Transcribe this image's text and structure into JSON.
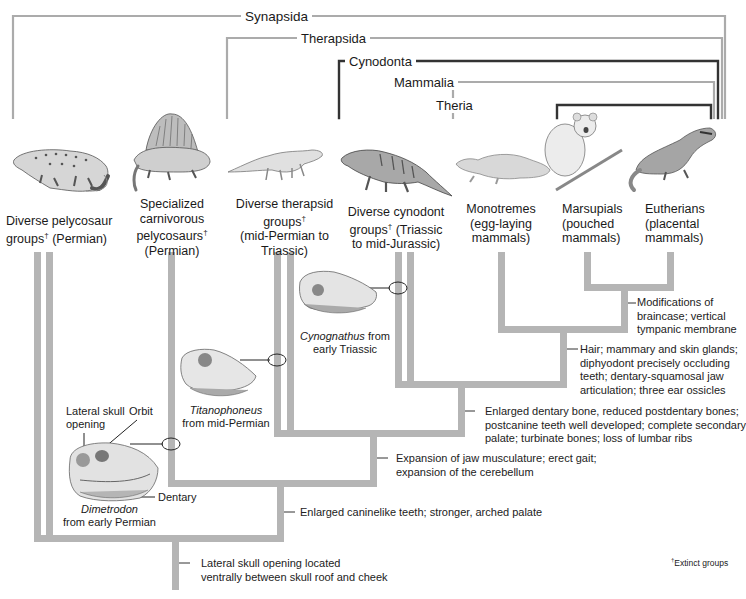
{
  "clades": [
    {
      "name": "Synapsida"
    },
    {
      "name": "Therapsida"
    },
    {
      "name": "Cynodonta"
    },
    {
      "name": "Mammalia"
    },
    {
      "name": "Theria"
    }
  ],
  "taxa": [
    {
      "lines": [
        "Diverse pelycosaur",
        "groups† (Permian)"
      ],
      "extinct": true
    },
    {
      "lines": [
        "Specialized",
        "carnivorous",
        "pelycosaurs†",
        "(Permian)"
      ],
      "extinct": true
    },
    {
      "lines": [
        "Diverse therapsid",
        "groups†",
        "(mid-Permian to",
        "Triassic)"
      ],
      "extinct": true
    },
    {
      "lines": [
        "Diverse cynodont",
        "groups† (Triassic",
        "to mid-Jurassic)"
      ],
      "extinct": true
    },
    {
      "lines": [
        "Monotremes",
        "(egg-laying",
        "mammals)"
      ],
      "extinct": false
    },
    {
      "lines": [
        "Marsupials",
        "(pouched",
        "mammals)"
      ],
      "extinct": false
    },
    {
      "lines": [
        "Eutherians",
        "(placental",
        "mammals)"
      ],
      "extinct": false
    }
  ],
  "taxa_text": {
    "t0_l1": "Diverse pelycosaur",
    "t0_l2": "groups",
    "t0_l2b": " (Permian)",
    "t1_l1": "Specialized",
    "t1_l2": "carnivorous",
    "t1_l3": "pelycosaurs",
    "t1_l4": "(Permian)",
    "t2_l1": "Diverse therapsid",
    "t2_l2": "groups",
    "t2_l3": "(mid-Permian to",
    "t2_l4": "Triassic)",
    "t3_l1": "Diverse cynodont",
    "t3_l2": "groups",
    "t3_l2b": " (Triassic",
    "t3_l3": "to mid-Jurassic)",
    "t4_l1": "Monotremes",
    "t4_l2": "(egg-laying",
    "t4_l3": "mammals)",
    "t5_l1": "Marsupials",
    "t5_l2": "(pouched",
    "t5_l3": "mammals)",
    "t6_l1": "Eutherians",
    "t6_l2": "(placental",
    "t6_l3": "mammals)",
    "dagger": "†"
  },
  "traits": {
    "theria": [
      "Modifications of",
      "braincase; vertical",
      "tympanic membrane"
    ],
    "mammalia": [
      "Hair; mammary and skin glands;",
      "diphyodont precisely occluding",
      "teeth; dentary-squamosal jaw",
      "articulation; three ear ossicles"
    ],
    "cynodonta": [
      "Enlarged dentary bone, reduced postdentary bones;",
      "postcanine teeth well developed; complete secondary",
      "palate; turbinate bones; loss of lumbar ribs"
    ],
    "therapsida": [
      "Expansion of jaw musculature; erect gait;",
      "expansion of the cerebellum"
    ],
    "sphenacodont": [
      "Enlarged caninelike teeth; stronger, arched palate"
    ],
    "synapsida": [
      "Lateral skull opening located",
      "ventrally between skull roof and cheek"
    ]
  },
  "fossils": {
    "cynognathus": {
      "genus": "Cynognathus",
      "rest1": " from",
      "line2": "early Triassic"
    },
    "titanophoneus": {
      "genus": "Titanophoneus",
      "line2": "from mid-Permian"
    },
    "dimetrodon": {
      "genus": "Dimetrodon",
      "line2": "from early Permian"
    }
  },
  "annotations": {
    "lateral_skull_l1": "Lateral skull",
    "lateral_skull_l2": "opening",
    "orbit": "Orbit",
    "dentary": "Dentary"
  },
  "footnote": {
    "symbol": "†",
    "text": "Extinct groups"
  },
  "colors": {
    "branch": "#b3b3b3",
    "bracket_light": "#aaaaaa",
    "bracket_dark": "#333333",
    "text": "#1a1a1a"
  }
}
